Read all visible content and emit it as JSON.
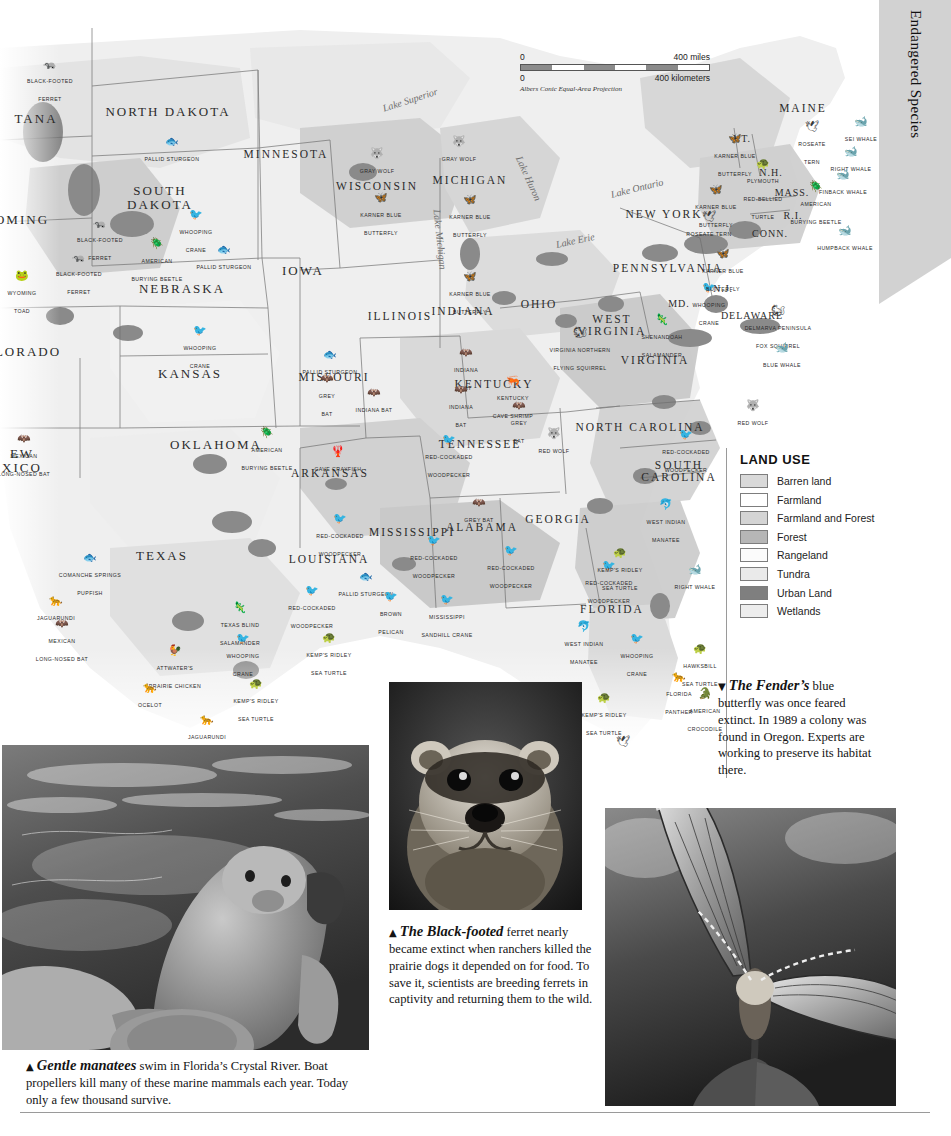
{
  "section_tab": {
    "title": "Endangered Species"
  },
  "map": {
    "scale": {
      "miles_zero": "0",
      "miles_max": "400 miles",
      "km_zero": "0",
      "km_max": "400 kilometers",
      "projection": "Albers Conic Equal-Area Projection"
    },
    "lakes": [
      {
        "name": "Lake Superior",
        "x": 383,
        "y": 95,
        "rot": -18
      },
      {
        "name": "Lake Michigan",
        "x": 437,
        "y": 196,
        "rot": 84
      },
      {
        "name": "Lake Huron",
        "x": 519,
        "y": 143,
        "rot": 66
      },
      {
        "name": "Lake Erie",
        "x": 556,
        "y": 231,
        "rot": -12
      },
      {
        "name": "Lake Ontario",
        "x": 611,
        "y": 181,
        "rot": -14
      }
    ],
    "states": [
      {
        "name": "NORTH DAKOTA",
        "x": 168,
        "y": 104,
        "size": "big"
      },
      {
        "name": "SOUTH\nDAKOTA",
        "x": 160,
        "y": 190,
        "size": "big"
      },
      {
        "name": "MINNESOTA",
        "x": 286,
        "y": 146,
        "size": "med"
      },
      {
        "name": "WISCONSIN",
        "x": 377,
        "y": 178,
        "size": "med"
      },
      {
        "name": "MICHIGAN",
        "x": 470,
        "y": 172,
        "size": "med"
      },
      {
        "name": "IOWA",
        "x": 303,
        "y": 263,
        "size": "big"
      },
      {
        "name": "NEBRASKA",
        "x": 182,
        "y": 281,
        "size": "big"
      },
      {
        "name": "TANA",
        "x": 36,
        "y": 111,
        "size": "big"
      },
      {
        "name": "OMING",
        "x": 22,
        "y": 212,
        "size": "big"
      },
      {
        "name": "LORADO",
        "x": 28,
        "y": 344,
        "size": "big"
      },
      {
        "name": "KANSAS",
        "x": 190,
        "y": 366,
        "size": "big"
      },
      {
        "name": "MISSOURI",
        "x": 334,
        "y": 369,
        "size": "med"
      },
      {
        "name": "ILLINOIS",
        "x": 400,
        "y": 308,
        "size": "med"
      },
      {
        "name": "INDIANA",
        "x": 463,
        "y": 303,
        "size": "med"
      },
      {
        "name": "OHIO",
        "x": 539,
        "y": 296,
        "size": "med"
      },
      {
        "name": "EW\nXICO",
        "x": 22,
        "y": 453,
        "size": "big"
      },
      {
        "name": "OKLAHOMA",
        "x": 216,
        "y": 437,
        "size": "big"
      },
      {
        "name": "ARKANSAS",
        "x": 330,
        "y": 465,
        "size": "med"
      },
      {
        "name": "TEXAS",
        "x": 162,
        "y": 548,
        "size": "big"
      },
      {
        "name": "LOUISIANA",
        "x": 329,
        "y": 551,
        "size": "med"
      },
      {
        "name": "MISSISSIPPI",
        "x": 412,
        "y": 524,
        "size": "med"
      },
      {
        "name": "ALABAMA",
        "x": 482,
        "y": 519,
        "size": "med"
      },
      {
        "name": "GEORGIA",
        "x": 558,
        "y": 511,
        "size": "med"
      },
      {
        "name": "TENNESSEE",
        "x": 480,
        "y": 436,
        "size": "med"
      },
      {
        "name": "KENTUCKY",
        "x": 494,
        "y": 376,
        "size": "med"
      },
      {
        "name": "WEST\nVIRGINIA",
        "x": 612,
        "y": 317,
        "size": "med"
      },
      {
        "name": "VIRGINIA",
        "x": 655,
        "y": 352,
        "size": "med"
      },
      {
        "name": "NORTH CAROLINA",
        "x": 640,
        "y": 419,
        "size": "med"
      },
      {
        "name": "SOUTH\nCAROLINA",
        "x": 679,
        "y": 463,
        "size": "med"
      },
      {
        "name": "FLORIDA",
        "x": 612,
        "y": 601,
        "size": "med"
      },
      {
        "name": "PENNSYLVANIA",
        "x": 668,
        "y": 260,
        "size": "med"
      },
      {
        "name": "NEW YORK",
        "x": 664,
        "y": 206,
        "size": "med"
      },
      {
        "name": "MAINE",
        "x": 803,
        "y": 100,
        "size": "med"
      },
      {
        "name": "VT.",
        "x": 742,
        "y": 131,
        "size": "sm"
      },
      {
        "name": "N.H.",
        "x": 771,
        "y": 165,
        "size": "sm"
      },
      {
        "name": "MASS.",
        "x": 792,
        "y": 185,
        "size": "sm"
      },
      {
        "name": "CONN.",
        "x": 770,
        "y": 226,
        "size": "sm"
      },
      {
        "name": "R.I.",
        "x": 793,
        "y": 208,
        "size": "sm"
      },
      {
        "name": "N.J.",
        "x": 723,
        "y": 281,
        "size": "sm"
      },
      {
        "name": "MD.",
        "x": 679,
        "y": 296,
        "size": "sm"
      },
      {
        "name": "DELAWARE",
        "x": 752,
        "y": 308,
        "size": "sm"
      }
    ],
    "species": [
      {
        "label": "BLACK-FOOTED\nFERRET",
        "icon": "ferret",
        "x": 50,
        "y": 73
      },
      {
        "label": "PALLID STURGEON",
        "icon": "fish",
        "x": 172,
        "y": 142
      },
      {
        "label": "WHOOPING\nCRANE",
        "icon": "crane",
        "x": 196,
        "y": 224
      },
      {
        "label": "BLACK-FOOTED\nFERRET",
        "icon": "ferret",
        "x": 100,
        "y": 232
      },
      {
        "label": "AMERICAN\nBURYING BEETLE",
        "icon": "beetle",
        "x": 157,
        "y": 253
      },
      {
        "label": "PALLID STURGEON",
        "icon": "fish",
        "x": 224,
        "y": 250
      },
      {
        "label": "BLACK-FOOTED\nFERRET",
        "icon": "ferret",
        "x": 79,
        "y": 266
      },
      {
        "label": "WYOMING\nTOAD",
        "icon": "toad",
        "x": 22,
        "y": 285
      },
      {
        "label": "WHOOPING\nCRANE",
        "icon": "crane",
        "x": 200,
        "y": 340
      },
      {
        "label": "MEXICAN\nLONG-NOSED  BAT",
        "icon": "bat",
        "x": 24,
        "y": 448
      },
      {
        "label": "GRAY WOLF",
        "icon": "wolf",
        "x": 377,
        "y": 154
      },
      {
        "label": "GRAY WOLF",
        "icon": "wolf",
        "x": 459,
        "y": 142
      },
      {
        "label": "KARNER BLUE\nBUTTERFLY",
        "icon": "butterfly",
        "x": 381,
        "y": 207
      },
      {
        "label": "KARNER BLUE\nBUTTERFLY",
        "icon": "butterfly",
        "x": 470,
        "y": 209
      },
      {
        "label": "KARNER BLUE\nBUTTERFLY",
        "icon": "butterfly",
        "x": 470,
        "y": 286
      },
      {
        "label": "PALLID STURGEON",
        "icon": "fish",
        "x": 330,
        "y": 355
      },
      {
        "label": "GREY\nBAT",
        "icon": "bat",
        "x": 327,
        "y": 388
      },
      {
        "label": "INDIANA BAT",
        "icon": "bat",
        "x": 374,
        "y": 393
      },
      {
        "label": "INDIANA\nBAT",
        "icon": "bat",
        "x": 466,
        "y": 362
      },
      {
        "label": "INDIANA\nBAT",
        "icon": "bat",
        "x": 461,
        "y": 399
      },
      {
        "label": "KENTUCKY\nCAVE SHRIMP",
        "icon": "shrimp",
        "x": 513,
        "y": 390
      },
      {
        "label": "GREY\nBAT",
        "icon": "bat",
        "x": 519,
        "y": 415
      },
      {
        "label": "CAVE CRAYFISH",
        "icon": "crayfish",
        "x": 338,
        "y": 452
      },
      {
        "label": "AMERICAN\nBURYING BEETLE",
        "icon": "beetle",
        "x": 267,
        "y": 442
      },
      {
        "label": "RED-COCKADED\nWOODPECKER",
        "icon": "bird",
        "x": 449,
        "y": 449
      },
      {
        "label": "GREY BAT",
        "icon": "bat",
        "x": 479,
        "y": 503
      },
      {
        "label": "RED-COCKADED\nWOODPECKER",
        "icon": "bird",
        "x": 340,
        "y": 528
      },
      {
        "label": "RED-COCKADED\nWOODPECKER",
        "icon": "bird",
        "x": 434,
        "y": 550
      },
      {
        "label": "RED-COCKADED\nWOODPECKER",
        "icon": "bird",
        "x": 511,
        "y": 560
      },
      {
        "label": "PALLID STURGEON",
        "icon": "fish",
        "x": 366,
        "y": 577
      },
      {
        "label": "RED-COCKADED\nWOODPECKER",
        "icon": "bird",
        "x": 312,
        "y": 600
      },
      {
        "label": "BROWN\nPELICAN",
        "icon": "pelican",
        "x": 391,
        "y": 606
      },
      {
        "label": "MISSISSIPPI\nSANDHILL CRANE",
        "icon": "crane",
        "x": 447,
        "y": 609
      },
      {
        "label": "RED-COCKADED\nWOODPECKER",
        "icon": "bird",
        "x": 609,
        "y": 575
      },
      {
        "label": "COMANCHE SPRINGS\nPUPFISH",
        "icon": "fish",
        "x": 90,
        "y": 567
      },
      {
        "label": "JAGUARUNDI",
        "icon": "cat",
        "x": 56,
        "y": 601
      },
      {
        "label": "MEXICAN\nLONG-NOSED  BAT",
        "icon": "bat",
        "x": 62,
        "y": 633
      },
      {
        "label": "TEXAS BLIND\nSALAMANDER",
        "icon": "salamander",
        "x": 240,
        "y": 617
      },
      {
        "label": "WHOOPING\nCRANE",
        "icon": "crane",
        "x": 243,
        "y": 648
      },
      {
        "label": "ATTWATER'S\nPRAIRIE CHICKEN",
        "icon": "chicken",
        "x": 175,
        "y": 660
      },
      {
        "label": "OCELOT",
        "icon": "cat",
        "x": 150,
        "y": 688
      },
      {
        "label": "KEMP'S RIDLEY\nSEA TURTLE",
        "icon": "turtle",
        "x": 256,
        "y": 693
      },
      {
        "label": "JAGUARUNDI",
        "icon": "cat",
        "x": 207,
        "y": 720
      },
      {
        "label": "KEMP'S RIDLEY\nSEA TURTLE",
        "icon": "turtle",
        "x": 329,
        "y": 647
      },
      {
        "label": "VIRGINIA NORTHERN\nFLYING SQUIRREL",
        "icon": "squirrel",
        "x": 580,
        "y": 342
      },
      {
        "label": "SHENANDOAH\nSALAMANDER",
        "icon": "salamander",
        "x": 662,
        "y": 329
      },
      {
        "label": "WHOOPING\nCRANE",
        "icon": "crane",
        "x": 709,
        "y": 297
      },
      {
        "label": "DELMARVA PENINSULA\nFOX  SQUIRREL",
        "icon": "squirrel",
        "x": 778,
        "y": 320
      },
      {
        "label": "BLUE WHALE",
        "icon": "whale",
        "x": 782,
        "y": 348
      },
      {
        "label": "RED WOLF",
        "icon": "wolf",
        "x": 753,
        "y": 406
      },
      {
        "label": "RED WOLF",
        "icon": "wolf",
        "x": 554,
        "y": 434
      },
      {
        "label": "RED-COCKADED\nWOODPECKER",
        "icon": "bird",
        "x": 686,
        "y": 444
      },
      {
        "label": "KEMP'S RIDLEY\nSEA TURTLE",
        "icon": "turtle",
        "x": 620,
        "y": 562
      },
      {
        "label": "RIGHT WHALE",
        "icon": "whale",
        "x": 695,
        "y": 570
      },
      {
        "label": "WEST INDIAN\nMANATEE",
        "icon": "manatee",
        "x": 666,
        "y": 514
      },
      {
        "label": "WEST INDIAN\nMANATEE",
        "icon": "manatee",
        "x": 584,
        "y": 636
      },
      {
        "label": "WHOOPING\nCRANE",
        "icon": "crane",
        "x": 637,
        "y": 648
      },
      {
        "label": "HAWKSBILL\nSEA TURTLE",
        "icon": "turtle",
        "x": 700,
        "y": 658
      },
      {
        "label": "FLORIDA\nPANTHER",
        "icon": "cat",
        "x": 679,
        "y": 686
      },
      {
        "label": "AMERICAN\nCROCODILE",
        "icon": "croc",
        "x": 705,
        "y": 703
      },
      {
        "label": "KEMP'S RIDLEY\nSEA TURTLE",
        "icon": "turtle",
        "x": 604,
        "y": 707
      },
      {
        "label": "ROSEATE TERN",
        "icon": "tern",
        "x": 623,
        "y": 742
      },
      {
        "label": "KARNER BLUE\nBUTTERFLY",
        "icon": "butterfly",
        "x": 735,
        "y": 148
      },
      {
        "label": "KARNER BLUE\nBUTTERFLY",
        "icon": "butterfly",
        "x": 716,
        "y": 199
      },
      {
        "label": "KARNER BLUE\nBUTTERFLY",
        "icon": "butterfly",
        "x": 723,
        "y": 263
      },
      {
        "label": "ROSEATE TERN",
        "icon": "tern",
        "x": 709,
        "y": 217
      },
      {
        "label": "PLYMOUTH\nRED-BELLIED\nTURTLE",
        "icon": "turtle",
        "x": 763,
        "y": 182
      },
      {
        "label": "AMERICAN\nBURYING BEETLE",
        "icon": "beetle",
        "x": 816,
        "y": 196
      },
      {
        "label": "ROSEATE\nTERN",
        "icon": "tern",
        "x": 812,
        "y": 136
      },
      {
        "label": "SEI WHALE",
        "icon": "whale",
        "x": 861,
        "y": 122
      },
      {
        "label": "RIGHT WHALE",
        "icon": "whale",
        "x": 851,
        "y": 152
      },
      {
        "label": "FINBACK WHALE",
        "icon": "whale",
        "x": 843,
        "y": 175
      },
      {
        "label": "HUMPBACK WHALE",
        "icon": "whale",
        "x": 845,
        "y": 231
      }
    ]
  },
  "legend": {
    "title": "LAND USE",
    "items": [
      {
        "label": "Barren land",
        "color": "#d9d9d9"
      },
      {
        "label": "Farmland",
        "color": "#ffffff"
      },
      {
        "label": "Farmland and Forest",
        "color": "#d4d4d4"
      },
      {
        "label": "Forest",
        "color": "#b6b6b6"
      },
      {
        "label": "Rangeland",
        "color": "#fbfbfb"
      },
      {
        "label": "Tundra",
        "color": "#eaeaea"
      },
      {
        "label": "Urban Land",
        "color": "#7f7f7f"
      },
      {
        "label": "Wetlands",
        "color": "#ededed"
      }
    ]
  },
  "photos": [
    {
      "id": "manatee-photo",
      "alt": "Two manatees swimming underwater",
      "caption_marker": "▲",
      "caption_lead": "Gentle manatees",
      "caption_body": " swim in Florida’s Crystal River. Boat propellers kill many of these marine mammals each year. Today only a few thousand survive."
    },
    {
      "id": "ferret-photo",
      "alt": "Close-up of a black-footed ferret face",
      "caption_marker": "▲",
      "caption_lead": "The Black-footed",
      "caption_body": " ferret nearly became extinct when ranchers killed the prairie dogs it depended on for food. To save it, scientists are breeding ferrets in captivity and returning them to the wild."
    },
    {
      "id": "butterfly-photo",
      "alt": "Fender’s blue butterfly perched on a plant",
      "caption_marker": "▼",
      "caption_lead": "The Fender’s",
      "caption_body": " blue butterfly was once feared extinct. In 1989 a colony was found in Oregon. Experts are working to preserve its habitat there."
    }
  ]
}
